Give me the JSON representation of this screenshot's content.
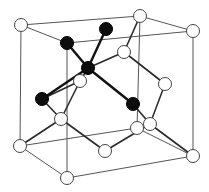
{
  "diagram": {
    "type": "unit-cell",
    "colors": {
      "background": "#ffffff",
      "edge": "#555555",
      "bond": "#2a2a2a",
      "highlight_atom": "#0d0d0d",
      "regular_atom": "#ffffff"
    },
    "atoms": [
      {
        "id": "a1",
        "role": "corner",
        "highlight": false
      },
      {
        "id": "a2",
        "role": "corner",
        "highlight": false
      },
      {
        "id": "a3",
        "role": "corner",
        "highlight": false
      },
      {
        "id": "a4",
        "role": "corner-highlighted",
        "highlight": true
      },
      {
        "id": "a5",
        "role": "face-center-highlighted",
        "highlight": true
      },
      {
        "id": "a6",
        "role": "interior-tetrahedral-center",
        "highlight": true
      },
      {
        "id": "a7",
        "role": "face-center-highlighted",
        "highlight": true
      },
      {
        "id": "a8",
        "role": "face-center-highlighted",
        "highlight": true
      },
      {
        "id": "a9",
        "role": "interior",
        "highlight": false
      },
      {
        "id": "a10",
        "role": "face-center",
        "highlight": false
      },
      {
        "id": "a11",
        "role": "face-center",
        "highlight": false
      },
      {
        "id": "a12",
        "role": "interior",
        "highlight": false
      },
      {
        "id": "a13",
        "role": "interior",
        "highlight": false
      },
      {
        "id": "a14",
        "role": "corner",
        "highlight": false
      },
      {
        "id": "a15",
        "role": "face-center",
        "highlight": false
      },
      {
        "id": "a16",
        "role": "corner",
        "highlight": false
      },
      {
        "id": "a17",
        "role": "corner",
        "highlight": false
      },
      {
        "id": "a18",
        "role": "corner",
        "highlight": false
      }
    ],
    "highlighted_count": 5
  }
}
